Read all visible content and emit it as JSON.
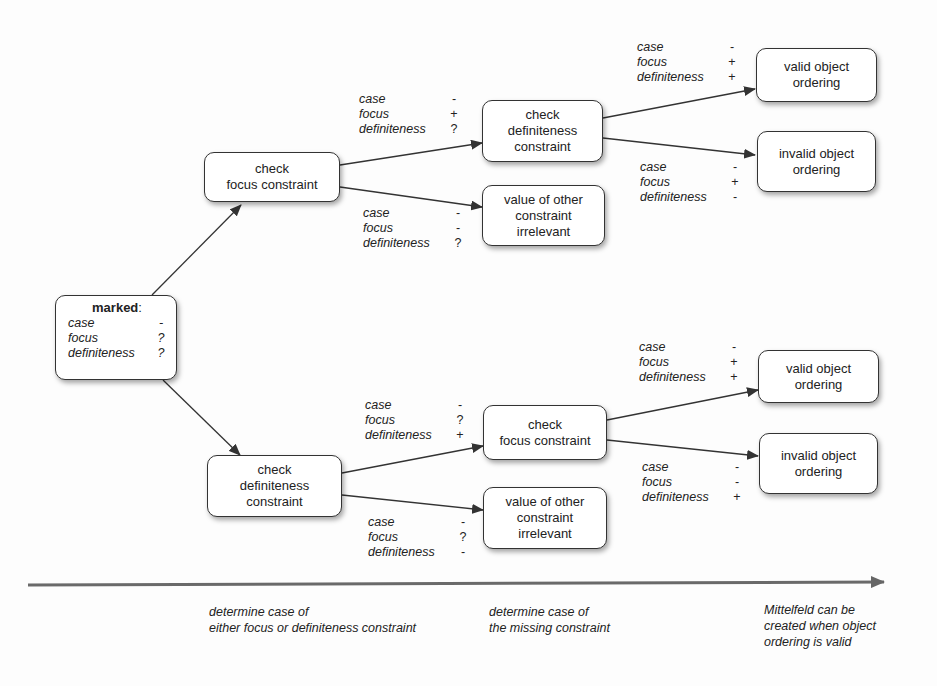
{
  "diagram": {
    "root": {
      "title": "marked",
      "colon": ":",
      "conditions": [
        {
          "key": "case",
          "value": "-"
        },
        {
          "key": "focus",
          "value": "?"
        },
        {
          "key": "definiteness",
          "value": "?"
        }
      ]
    },
    "top_branch": {
      "check_node": {
        "lines": [
          "check",
          "focus constraint"
        ]
      },
      "edge_to_next": [
        {
          "key": "case",
          "value": "-"
        },
        {
          "key": "focus",
          "value": "+"
        },
        {
          "key": "definiteness",
          "value": "?"
        }
      ],
      "edge_to_irrelevant": [
        {
          "key": "case",
          "value": "-"
        },
        {
          "key": "focus",
          "value": "-"
        },
        {
          "key": "definiteness",
          "value": "?"
        }
      ],
      "second_check_node": {
        "lines": [
          "check",
          "definiteness",
          "constraint"
        ]
      },
      "irrelevant_node": {
        "lines": [
          "value of other",
          "constraint",
          "irrelevant"
        ]
      },
      "edge_to_valid": [
        {
          "key": "case",
          "value": "-"
        },
        {
          "key": "focus",
          "value": "+"
        },
        {
          "key": "definiteness",
          "value": "+"
        }
      ],
      "edge_to_invalid": [
        {
          "key": "case",
          "value": "-"
        },
        {
          "key": "focus",
          "value": "+"
        },
        {
          "key": "definiteness",
          "value": "-"
        }
      ],
      "valid_node": {
        "lines": [
          "valid object",
          "ordering"
        ]
      },
      "invalid_node": {
        "lines": [
          "invalid object",
          "ordering"
        ]
      }
    },
    "bottom_branch": {
      "check_node": {
        "lines": [
          "check",
          "definiteness",
          "constraint"
        ]
      },
      "edge_to_next": [
        {
          "key": "case",
          "value": "-"
        },
        {
          "key": "focus",
          "value": "?"
        },
        {
          "key": "definiteness",
          "value": "+"
        }
      ],
      "edge_to_irrelevant": [
        {
          "key": "case",
          "value": "-"
        },
        {
          "key": "focus",
          "value": "?"
        },
        {
          "key": "definiteness",
          "value": "-"
        }
      ],
      "second_check_node": {
        "lines": [
          "check",
          "focus constraint"
        ]
      },
      "irrelevant_node": {
        "lines": [
          "value of other",
          "constraint",
          "irrelevant"
        ]
      },
      "edge_to_valid": [
        {
          "key": "case",
          "value": "-"
        },
        {
          "key": "focus",
          "value": "+"
        },
        {
          "key": "definiteness",
          "value": "+"
        }
      ],
      "edge_to_invalid": [
        {
          "key": "case",
          "value": "-"
        },
        {
          "key": "focus",
          "value": "-"
        },
        {
          "key": "definiteness",
          "value": "+"
        }
      ],
      "valid_node": {
        "lines": [
          "valid object",
          "ordering"
        ]
      },
      "invalid_node": {
        "lines": [
          "invalid object",
          "ordering"
        ]
      }
    },
    "timeline": {
      "captions": [
        {
          "lines": [
            "determine case of",
            "either focus or definiteness constraint"
          ]
        },
        {
          "lines": [
            "determine case of",
            "the missing constraint"
          ]
        },
        {
          "lines": [
            "Mittelfeld can be",
            "created when object",
            "ordering is valid"
          ]
        }
      ]
    }
  }
}
